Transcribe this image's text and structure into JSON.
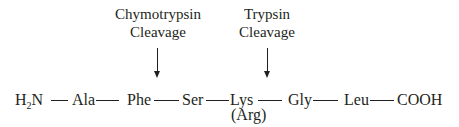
{
  "diagram": {
    "type": "peptide-cleavage-sites",
    "annotations": [
      {
        "line1": "Chymotrypsin",
        "line2": "Cleavage",
        "target_bond": "Phe-Ser"
      },
      {
        "line1": "Trypsin",
        "line2": "Cleavage",
        "target_bond": "Lys-Gly"
      }
    ],
    "chain": {
      "n_terminus": {
        "main": "H",
        "subscript": "2",
        "rest": "N"
      },
      "residues": [
        "Ala",
        "Phe",
        "Ser",
        "Lys",
        "Gly",
        "Leu"
      ],
      "alt_residue_note": "(Arg)",
      "c_terminus": "COOH"
    },
    "bond_symbol": "—"
  }
}
